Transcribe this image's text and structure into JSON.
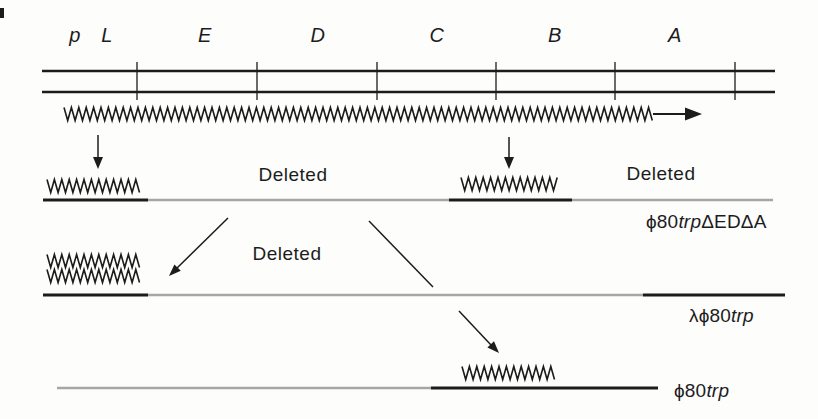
{
  "palette": {
    "ink": "#1c1c1c",
    "deleted_gray": "#a6a6a6",
    "background": "#fdfdfc"
  },
  "gene_map": {
    "regions": [
      {
        "label": "p"
      },
      {
        "label": "L"
      },
      {
        "label": "E"
      },
      {
        "label": "D"
      },
      {
        "label": "C"
      },
      {
        "label": "B"
      },
      {
        "label": "A"
      }
    ]
  },
  "annotations": {
    "deleted_row1_middle": "Deleted",
    "deleted_row1_right": "Deleted",
    "deleted_row2": "Deleted"
  },
  "strains": [
    {
      "name_prefix": "ϕ80",
      "name_italic": "trp",
      "name_suffix": "ΔEDΔA"
    },
    {
      "name_prefix": "λϕ80",
      "name_italic": "trp",
      "name_suffix": ""
    },
    {
      "name_prefix": "ϕ80",
      "name_italic": "trp",
      "name_suffix": ""
    }
  ]
}
